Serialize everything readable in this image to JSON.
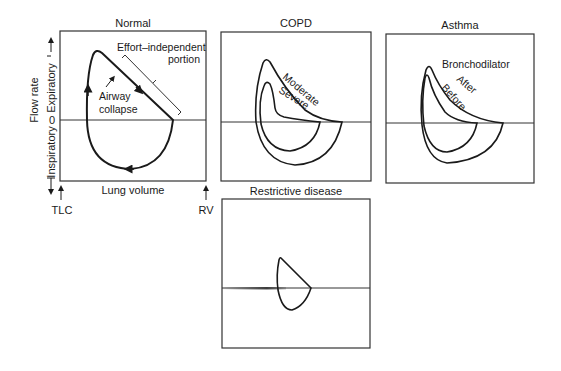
{
  "panels": {
    "normal": {
      "title": "Normal",
      "annotation_effort_line1": "Effort–independent",
      "annotation_effort_line2": "portion",
      "annotation_airway_line1": "Airway",
      "annotation_airway_line2": "collapse",
      "zero_label": "0",
      "x_axis_label": "Lung volume",
      "y_axis_label": "Flow rate",
      "y_upper_label": "Expiratory",
      "y_lower_label": "Inspiratory",
      "x_left_marker": "TLC",
      "x_right_marker": "RV"
    },
    "copd": {
      "title": "COPD",
      "curve_labels": [
        "Moderate",
        "Severe"
      ]
    },
    "asthma": {
      "title": "Asthma",
      "annotation": "Bronchodilator",
      "curve_labels": [
        "After",
        "Before"
      ]
    },
    "restrictive": {
      "title": "Restrictive disease"
    }
  },
  "colors": {
    "line": "#1a1a1a",
    "frame": "#333333",
    "background": "#ffffff"
  }
}
